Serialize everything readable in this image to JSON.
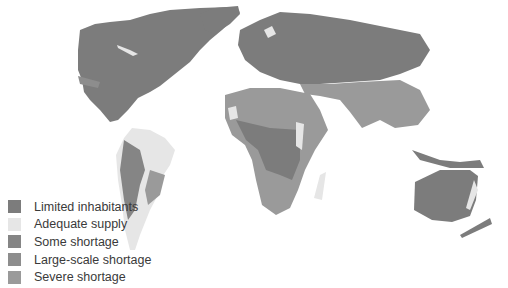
{
  "map": {
    "type": "world-water-availability",
    "legend": {
      "items": [
        {
          "label": "Limited inhabitants",
          "color": "#7c7c7c"
        },
        {
          "label": "Adequate supply",
          "color": "#e6e6e6"
        },
        {
          "label": "Some shortage",
          "color": "#858585"
        },
        {
          "label": "Large-scale shortage",
          "color": "#8d8d8d"
        },
        {
          "label": "Severe shortage",
          "color": "#9a9a9a"
        }
      ]
    }
  }
}
